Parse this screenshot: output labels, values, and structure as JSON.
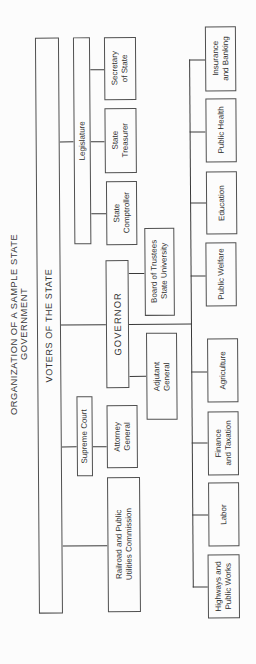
{
  "title": "ORGANIZATION OF A SAMPLE STATE GOVERNMENT",
  "root": {
    "label": "VOTERS OF THE STATE"
  },
  "legislative": {
    "label": "Legislature",
    "offices": [
      {
        "label": "State\nComptroller"
      },
      {
        "label": "State\nTreasurer"
      },
      {
        "label": "Secretary\nof State"
      }
    ]
  },
  "executive": {
    "label": "GOVERNOR",
    "attached": [
      {
        "label": "Adjutant\nGeneral"
      },
      {
        "label": "Board of Trustees\nState University"
      }
    ],
    "departments": [
      {
        "label": "Highways and\nPublic Works"
      },
      {
        "label": "Labor"
      },
      {
        "label": "Finance\nand Taxation"
      },
      {
        "label": "Agriculture"
      },
      {
        "label": "Public Welfare"
      },
      {
        "label": "Education"
      },
      {
        "label": "Public Health"
      },
      {
        "label": "Insurance\nand Banking"
      }
    ]
  },
  "judicial": {
    "label": "Supreme Court",
    "offices": [
      {
        "label": "Attorney\nGeneral"
      }
    ]
  },
  "commission": {
    "label": "Railroad and Public\nUtilities Commission"
  },
  "colors": {
    "line": "#3a3a3a",
    "border": "#505050",
    "text": "#333333",
    "background": "#fcfcfc"
  }
}
